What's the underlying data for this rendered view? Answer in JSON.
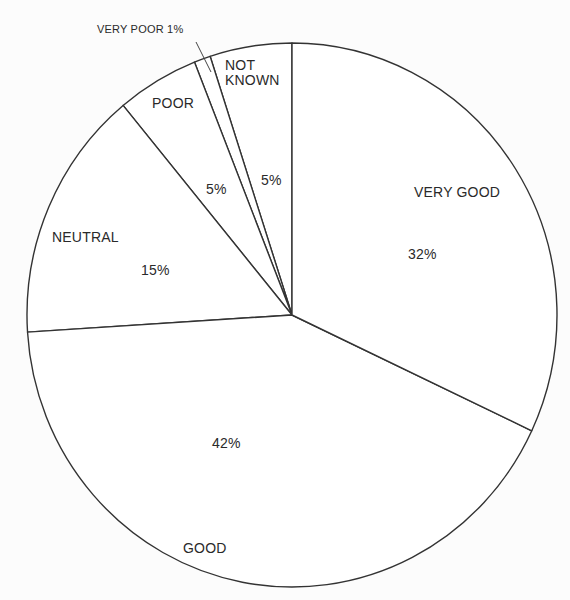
{
  "chart_data": {
    "type": "pie",
    "title": "",
    "start": "top, counter-clockwise for first slices",
    "categories": [
      "NOT KNOWN",
      "VERY POOR",
      "POOR",
      "NEUTRAL",
      "GOOD",
      "VERY GOOD"
    ],
    "values": [
      5,
      1,
      5,
      15,
      42,
      32
    ],
    "unit": "%",
    "slices": [
      {
        "label": "NOT KNOWN",
        "value": 5,
        "value_label": "5%"
      },
      {
        "label": "VERY POOR",
        "value": 1,
        "value_label": "1%",
        "label_text": "VERY POOR 1%"
      },
      {
        "label": "POOR",
        "value": 5,
        "value_label": "5%"
      },
      {
        "label": "NEUTRAL",
        "value": 15,
        "value_label": "15%"
      },
      {
        "label": "GOOD",
        "value": 42,
        "value_label": "42%"
      },
      {
        "label": "VERY GOOD",
        "value": 32,
        "value_label": "32%"
      }
    ],
    "legend": "none (labels on slices)",
    "colors": {
      "fill": "#ffffff",
      "stroke": "#333333",
      "text": "#2a2a2a"
    }
  },
  "labels": {
    "not_known_line1": "NOT",
    "not_known_line2": "KNOWN",
    "not_known_pct": "5%",
    "very_poor": "VERY POOR 1%",
    "poor": "POOR",
    "poor_pct": "5%",
    "neutral": "NEUTRAL",
    "neutral_pct": "15%",
    "good": "GOOD",
    "good_pct": "42%",
    "very_good": "VERY GOOD",
    "very_good_pct": "32%"
  }
}
